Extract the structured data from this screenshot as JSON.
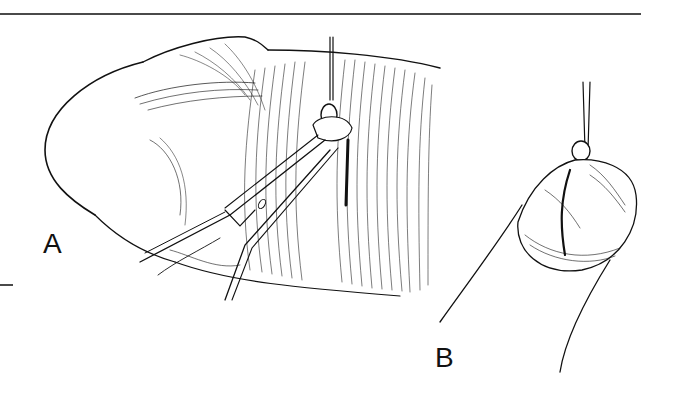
{
  "figure": {
    "panels": [
      {
        "id": "A",
        "label": "A",
        "description": "finger with scissors and retractor at incision"
      },
      {
        "id": "B",
        "label": "B",
        "description": "close-up of incision with retracted tissue"
      }
    ],
    "colors": {
      "ink": "#111111",
      "rule": "#4a4a4a",
      "background": "#ffffff"
    }
  }
}
